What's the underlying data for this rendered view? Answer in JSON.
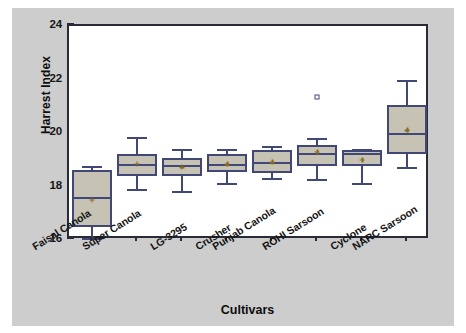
{
  "chart_data": {
    "type": "box",
    "title": "",
    "xlabel": "Cultivars",
    "ylabel": "Harrest Index",
    "ylim": [
      16,
      24
    ],
    "yticks": [
      16,
      18,
      20,
      22,
      24
    ],
    "ytick_labels": [
      "16",
      "18",
      "20",
      "22",
      "24"
    ],
    "minor_ticks_per_interval": 4,
    "grid": false,
    "legend": "none",
    "box_fill_color": "#c6c3b4",
    "box_line_color": "#414777",
    "mean_marker_color": "#8a6a20",
    "panel_background": "#cdcdcd",
    "plot_background": "#ffffff",
    "frame_color": "#2b2b38",
    "categories": [
      "Faisal Canola",
      "Super Canola",
      "LG-3295",
      "Crusher",
      "Punjab Canola",
      "ROHI Sarsoon",
      "Cyclone",
      "NARC Sarsoon"
    ],
    "boxes": [
      {
        "category": "Faisal Canola",
        "whisker_low": 16.0,
        "q1": 16.5,
        "median": 17.6,
        "mean": 17.5,
        "q3": 18.6,
        "whisker_high": 18.75,
        "outliers": []
      },
      {
        "category": "Super Canola",
        "whisker_low": 17.85,
        "q1": 18.4,
        "median": 18.85,
        "mean": 18.85,
        "q3": 19.2,
        "whisker_high": 19.85,
        "outliers": []
      },
      {
        "category": "LG-3295",
        "whisker_low": 17.75,
        "q1": 18.4,
        "median": 18.8,
        "mean": 18.72,
        "q3": 19.05,
        "whisker_high": 19.4,
        "outliers": []
      },
      {
        "category": "Crusher",
        "whisker_low": 18.05,
        "q1": 18.55,
        "median": 18.85,
        "mean": 18.83,
        "q3": 19.2,
        "whisker_high": 19.4,
        "outliers": []
      },
      {
        "category": "Punjab Canola",
        "whisker_low": 18.25,
        "q1": 18.5,
        "median": 18.9,
        "mean": 18.9,
        "q3": 19.35,
        "whisker_high": 19.5,
        "outliers": []
      },
      {
        "category": "ROHI Sarsoon",
        "whisker_low": 18.2,
        "q1": 18.75,
        "median": 19.25,
        "mean": 19.3,
        "q3": 19.55,
        "whisker_high": 19.8,
        "outliers": [
          21.35
        ]
      },
      {
        "category": "Cyclone",
        "whisker_low": 18.05,
        "q1": 18.75,
        "median": 19.25,
        "mean": 19.0,
        "q3": 19.35,
        "whisker_high": 19.4,
        "outliers": []
      },
      {
        "category": "NARC Sarsoon",
        "whisker_low": 18.65,
        "q1": 19.2,
        "median": 20.0,
        "mean": 20.1,
        "q3": 21.05,
        "whisker_high": 22.0,
        "outliers": []
      }
    ]
  }
}
